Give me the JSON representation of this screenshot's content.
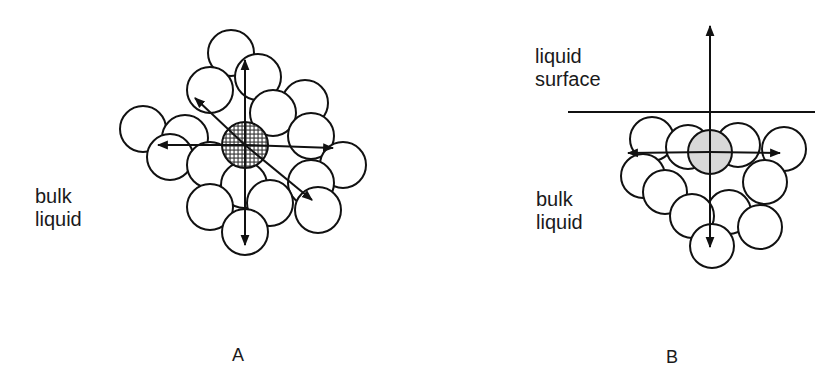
{
  "panel_a": {
    "id_label": "A",
    "region_label_line1": "bulk",
    "region_label_line2": "liquid",
    "central_molecule": {
      "cx": 245,
      "cy": 145,
      "r": 23,
      "fill": "hatched"
    },
    "neighbors": [
      {
        "cx": 231,
        "cy": 53,
        "r": 23
      },
      {
        "cx": 258,
        "cy": 77,
        "r": 23
      },
      {
        "cx": 210,
        "cy": 90,
        "r": 23
      },
      {
        "cx": 305,
        "cy": 103,
        "r": 23
      },
      {
        "cx": 273,
        "cy": 113,
        "r": 23
      },
      {
        "cx": 143,
        "cy": 129,
        "r": 23
      },
      {
        "cx": 185,
        "cy": 138,
        "r": 23
      },
      {
        "cx": 311,
        "cy": 136,
        "r": 23
      },
      {
        "cx": 170,
        "cy": 157,
        "r": 23
      },
      {
        "cx": 210,
        "cy": 165,
        "r": 23
      },
      {
        "cx": 343,
        "cy": 165,
        "r": 23
      },
      {
        "cx": 244,
        "cy": 185,
        "r": 23
      },
      {
        "cx": 311,
        "cy": 183,
        "r": 23
      },
      {
        "cx": 210,
        "cy": 207,
        "r": 23
      },
      {
        "cx": 270,
        "cy": 203,
        "r": 23
      },
      {
        "cx": 318,
        "cy": 210,
        "r": 23
      },
      {
        "cx": 245,
        "cy": 232,
        "r": 23
      }
    ],
    "forces": [
      {
        "direction": "up",
        "x2": 245,
        "y2": 60
      },
      {
        "direction": "down",
        "x2": 245,
        "y2": 245
      },
      {
        "direction": "left",
        "x2": 158,
        "y2": 145
      },
      {
        "direction": "right",
        "x2": 333,
        "y2": 148
      },
      {
        "direction": "up-left",
        "x2": 195,
        "y2": 98
      },
      {
        "direction": "down-right",
        "x2": 312,
        "y2": 200
      }
    ]
  },
  "panel_b": {
    "id_label": "B",
    "surface_label_line1": "liquid",
    "surface_label_line2": "surface",
    "region_label_line1": "bulk",
    "region_label_line2": "liquid",
    "surface_line": {
      "x1": 568,
      "x2": 815,
      "y": 112
    },
    "central_molecule": {
      "cx": 710,
      "cy": 152,
      "r": 22,
      "fill": "#d8d8d8"
    },
    "neighbors": [
      {
        "cx": 652,
        "cy": 139,
        "r": 22
      },
      {
        "cx": 688,
        "cy": 147,
        "r": 22
      },
      {
        "cx": 738,
        "cy": 145,
        "r": 22
      },
      {
        "cx": 784,
        "cy": 149,
        "r": 22
      },
      {
        "cx": 643,
        "cy": 176,
        "r": 22
      },
      {
        "cx": 665,
        "cy": 192,
        "r": 22
      },
      {
        "cx": 729,
        "cy": 212,
        "r": 22
      },
      {
        "cx": 765,
        "cy": 182,
        "r": 22
      },
      {
        "cx": 692,
        "cy": 216,
        "r": 22
      },
      {
        "cx": 760,
        "cy": 227,
        "r": 22
      },
      {
        "cx": 712,
        "cy": 246,
        "r": 22
      }
    ],
    "forces": [
      {
        "direction": "up",
        "x2": 710,
        "y2": 26
      },
      {
        "direction": "left",
        "x2": 628,
        "y2": 153
      },
      {
        "direction": "right",
        "x2": 780,
        "y2": 153
      },
      {
        "direction": "down",
        "x2": 710,
        "y2": 247
      }
    ]
  },
  "colors": {
    "ink": "#111111",
    "background": "#ffffff",
    "shaded": "#d8d8d8"
  }
}
